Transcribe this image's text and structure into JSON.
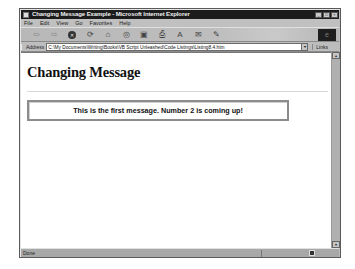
{
  "window": {
    "title": "Changing Message Example - Microsoft Internet Explorer",
    "controls": [
      "minimize",
      "maximize",
      "close"
    ]
  },
  "menubar": {
    "items": [
      "File",
      "Edit",
      "View",
      "Go",
      "Favorites",
      "Help"
    ]
  },
  "toolbar": {
    "buttons": [
      {
        "name": "back",
        "icon": "back-arrow-icon",
        "glyph": "⇦"
      },
      {
        "name": "forward",
        "icon": "forward-arrow-icon",
        "glyph": "⇨"
      },
      {
        "name": "stop",
        "icon": "stop-icon",
        "glyph": "✕"
      },
      {
        "name": "refresh",
        "icon": "refresh-icon",
        "glyph": "⟳"
      },
      {
        "name": "home",
        "icon": "home-icon",
        "glyph": "⌂"
      },
      {
        "name": "search",
        "icon": "search-icon",
        "glyph": "◎"
      },
      {
        "name": "favorites",
        "icon": "favorites-icon",
        "glyph": "▣"
      },
      {
        "name": "print",
        "icon": "print-icon",
        "glyph": "⎙"
      },
      {
        "name": "font",
        "icon": "font-icon",
        "glyph": "A"
      },
      {
        "name": "mail",
        "icon": "mail-icon",
        "glyph": "✉"
      },
      {
        "name": "edit",
        "icon": "edit-icon",
        "glyph": "✎"
      }
    ]
  },
  "addressbar": {
    "label": "Address",
    "value": "C:\\My Documents\\Writing\\Books\\VB Script Unleashed\\Code Listings\\Listing8.4.htm",
    "links_label": "Links"
  },
  "page": {
    "heading": "Changing Message",
    "message": "This is the first message.  Number 2 is coming up!"
  },
  "statusbar": {
    "text": "Done"
  }
}
